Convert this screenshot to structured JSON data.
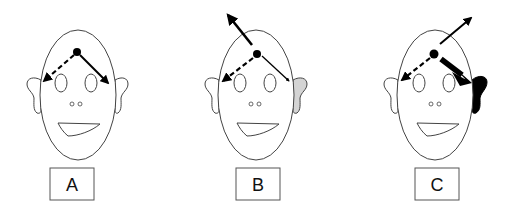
{
  "figure": {
    "panels": [
      {
        "id": "A",
        "label": "A",
        "cx": 78,
        "right_ear_fill": "#ffffff",
        "arrows": [
          {
            "kind": "dashed",
            "direction": "left-ear"
          },
          {
            "kind": "solid",
            "direction": "right-ear",
            "weight": "normal"
          }
        ]
      },
      {
        "id": "B",
        "label": "B",
        "cx": 256,
        "right_ear_fill": "#d4d4d4",
        "arrows": [
          {
            "kind": "dashed",
            "direction": "left-ear"
          },
          {
            "kind": "solid",
            "direction": "right-ear",
            "weight": "thin"
          },
          {
            "kind": "solid",
            "direction": "up-left",
            "weight": "thick"
          }
        ]
      },
      {
        "id": "C",
        "label": "C",
        "cx": 434,
        "right_ear_fill": "#000000",
        "arrows": [
          {
            "kind": "dashed",
            "direction": "left-ear"
          },
          {
            "kind": "solid",
            "direction": "right-ear",
            "weight": "very-thick"
          },
          {
            "kind": "solid",
            "direction": "up-right",
            "weight": "normal"
          }
        ]
      }
    ],
    "colors": {
      "outline": "#333333",
      "arrow": "#000000",
      "ear_gray": "#d4d4d4",
      "ear_black": "#000000"
    }
  }
}
